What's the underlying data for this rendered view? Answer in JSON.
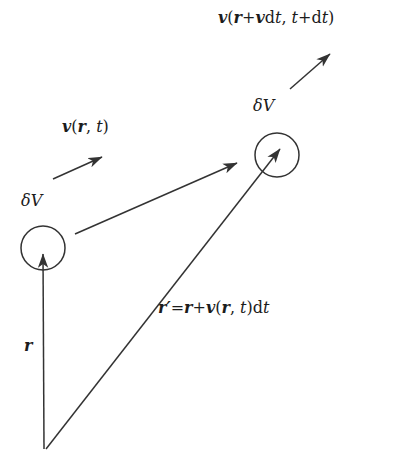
{
  "figure": {
    "width": 419,
    "height": 467,
    "background_color": "#ffffff",
    "stroke_color": "#333333",
    "text_color": "#1c1c1c"
  },
  "labels": {
    "velocity_advected": {
      "name": "v(r+vdt, t+dt)",
      "parts": {
        "v": "v",
        "open": "(",
        "r": "r",
        "plus": "+",
        "v2": "v",
        "d1": "d",
        "t1": "t",
        "comma": ", ",
        "t2": "t",
        "plus2": "+",
        "d2": "d",
        "t3": "t",
        "close": ")"
      }
    },
    "velocity_field": {
      "name": "v(r, t)",
      "parts": {
        "v": "v",
        "open": "(",
        "r": "r",
        "comma": ", ",
        "t": "t",
        "close": ")"
      }
    },
    "volume_left": {
      "name": "delta-V",
      "parts": {
        "delta": "δ",
        "V": "V"
      }
    },
    "volume_right": {
      "name": "delta-V",
      "parts": {
        "delta": "δ",
        "V": "V"
      }
    },
    "position_prime": {
      "name": "r' = r + v(r, t)dt",
      "parts": {
        "r_prime": "r′",
        "equals": "=",
        "r": "r",
        "plus": "+",
        "v": "v",
        "open": "(",
        "r2": "r",
        "comma": ", ",
        "t": "t",
        "close": ")",
        "d": "d",
        "t2": "t"
      }
    },
    "position": {
      "name": "r",
      "parts": {
        "r": "r"
      }
    }
  },
  "geometry": {
    "origin": {
      "x": 44,
      "y": 449
    },
    "circle_left": {
      "cx": 43,
      "cy": 248,
      "r": 22
    },
    "circle_right": {
      "cx": 277,
      "cy": 155,
      "r": 22
    },
    "arrow_r": {
      "x1": 44,
      "y1": 449,
      "x2": 43,
      "y2": 252
    },
    "arrow_r_prime": {
      "x1": 46,
      "y1": 449,
      "x2": 281,
      "y2": 148
    },
    "arrow_displacement": {
      "x1": 75,
      "y1": 234,
      "x2": 237,
      "y2": 163
    },
    "arrow_velocity_field": {
      "x1": 53,
      "y1": 179,
      "x2": 102,
      "y2": 157
    },
    "arrow_velocity_advected": {
      "x1": 290,
      "y1": 89,
      "x2": 330,
      "y2": 54
    }
  }
}
